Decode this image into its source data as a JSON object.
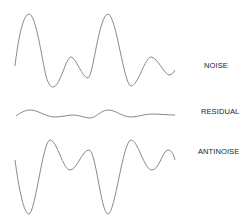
{
  "diagram": {
    "signals": [
      {
        "id": "noise",
        "label": "NOISE"
      },
      {
        "id": "residual",
        "label": "RESIDUAL"
      },
      {
        "id": "antinoise",
        "label": "ANTINOISE"
      }
    ],
    "colors": {
      "wave": "#8a8a8a",
      "text": "#222222",
      "background": "#ffffff"
    }
  }
}
